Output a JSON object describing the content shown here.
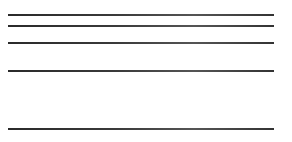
{
  "canvas": {
    "width": 292,
    "height": 142,
    "background": "#ffffff"
  },
  "lines": [
    {
      "y": 14,
      "x_start": 8,
      "x_end": 274,
      "color": "#2f2f2f"
    },
    {
      "y": 25,
      "x_start": 8,
      "x_end": 274,
      "color": "#2f2f2f"
    },
    {
      "y": 42,
      "x_start": 8,
      "x_end": 274,
      "color": "#2f2f2f"
    },
    {
      "y": 70,
      "x_start": 8,
      "x_end": 274,
      "color": "#2f2f2f"
    },
    {
      "y": 128,
      "x_start": 8,
      "x_end": 274,
      "color": "#2f2f2f"
    }
  ]
}
